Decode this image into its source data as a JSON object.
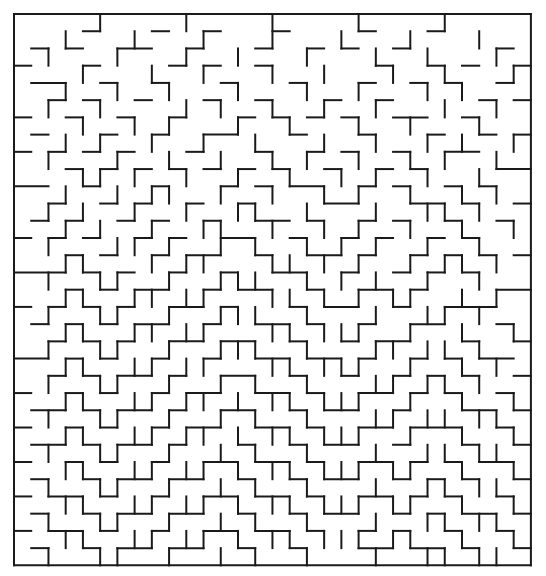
{
  "page": {
    "background_color": "#ffffff",
    "wall_color": "#1a1a1a"
  },
  "maze": {
    "type": "rectangular-perfect-maze",
    "cols": 30,
    "rows": 32,
    "origin_x": 14,
    "origin_y": 14,
    "cell_size": 17.23,
    "wall_thickness": 2,
    "border": "closed-on-all-sides",
    "entrance": null,
    "exit": null,
    "horizontal_walls": [
      "111111111111111111111111111111",
      "000010001001000100001000100000",
      "010100110010001001010010000010",
      "100010000101001000000100101001",
      "011001001000100010001001010010",
      "001010010001001000100100000101",
      "100100100100010101010011001000",
      "010001001001100010001000100101",
      "101010100010001001010010011000",
      "000101010101010100100101000011",
      "110010001000101011001010010100",
      "001001010010010000110001101001",
      "010100101001001101001010010010",
      "101010010100110010010100101000",
      "000101001011001001101001010101",
      "111010100100100110010010101000",
      "000101011001011001001101000011",
      "101010100110100010110010011100",
      "010101011001001101001001100010",
      "001010100110110010010110001001",
      "110101001001001101101001010110",
      "001010110100110010010010101001",
      "100101001011001101001101010010",
      "011010110100110010110010001101",
      "100101001011001101001101110010",
      "011010110100010010110010001001",
      "100101001001101101001101010110",
      "010010110110010010110010101001",
      "101101001001101101001101010010",
      "010010110110010010110010101101",
      "101101001001101101001010010010",
      "010010110110010010001101101001",
      "111111111111111111111111111111"
    ],
    "vertical_walls": [
      "1000010000100001000010000100001",
      "1001000100010001000100010001001",
      "1010001000100100010001001000101",
      "1000100010010001001000100100011",
      "1001001001000100010010001010001",
      "1010010000101001001001000100101",
      "1000100101000100100010010001001",
      "1001010010010010001001001010011",
      "1010001001001001010010010100101",
      "1000110100100100100101001001001",
      "1001001011001001001010010010101",
      "1010100100100110010001001101001",
      "1001010010011001001010010010011",
      "1010001101001010010101001001001",
      "1001100010110001101010010110101",
      "1010011001001110010101001001001",
      "1001100110110001101010110010101",
      "1010011001001110010001001101001",
      "1001100110110001101110010010011",
      "1010011001001110010001101101001",
      "1001100110110001101110010010101",
      "1010011001001010010001101101001",
      "1001100110110101101110010010011",
      "1010011001001010010001101101101",
      "1001100110110101101110010010011",
      "1010011001001010010001001101101",
      "1001100110110101101110110010011",
      "1010011001001010010001001101101",
      "1001100110110101101110110010011",
      "1010011001001010010001001101101",
      "1001100110110101101110110010011",
      "1010011001001010010001001101101"
    ]
  }
}
